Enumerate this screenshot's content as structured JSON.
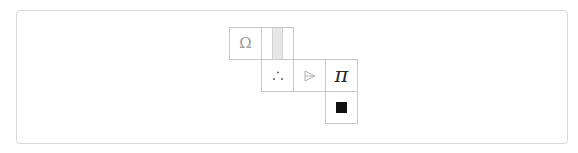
{
  "board": {
    "cell_size": 32,
    "origin": {
      "x": 229,
      "y": 27
    },
    "cells": [
      {
        "id": "c-0-0",
        "row": 0,
        "col": 0,
        "symbol": "Ω",
        "kind": "omega"
      },
      {
        "id": "c-0-1",
        "row": 0,
        "col": 1,
        "symbol": "",
        "kind": "stripe"
      },
      {
        "id": "c-1-1",
        "row": 1,
        "col": 1,
        "symbol": "∴",
        "kind": "dots"
      },
      {
        "id": "c-1-2",
        "row": 1,
        "col": 2,
        "symbol": "",
        "kind": "arrow"
      },
      {
        "id": "c-1-3",
        "row": 1,
        "col": 3,
        "symbol": "π",
        "kind": "pi"
      },
      {
        "id": "c-2-3",
        "row": 2,
        "col": 3,
        "symbol": "",
        "kind": "black-square"
      }
    ]
  },
  "icons": {
    "omega": "omega-icon",
    "stripe": "stripe-icon",
    "dots": "therefore-dots-icon",
    "arrow": "arrow-triangle-icon",
    "pi": "pi-icon",
    "black-square": "black-square-icon"
  },
  "colors": {
    "frame_border": "#d9d9d9",
    "cell_border": "#c8c8c8",
    "stripe_fill": "#e6e6e6",
    "square_fill": "#111111"
  }
}
